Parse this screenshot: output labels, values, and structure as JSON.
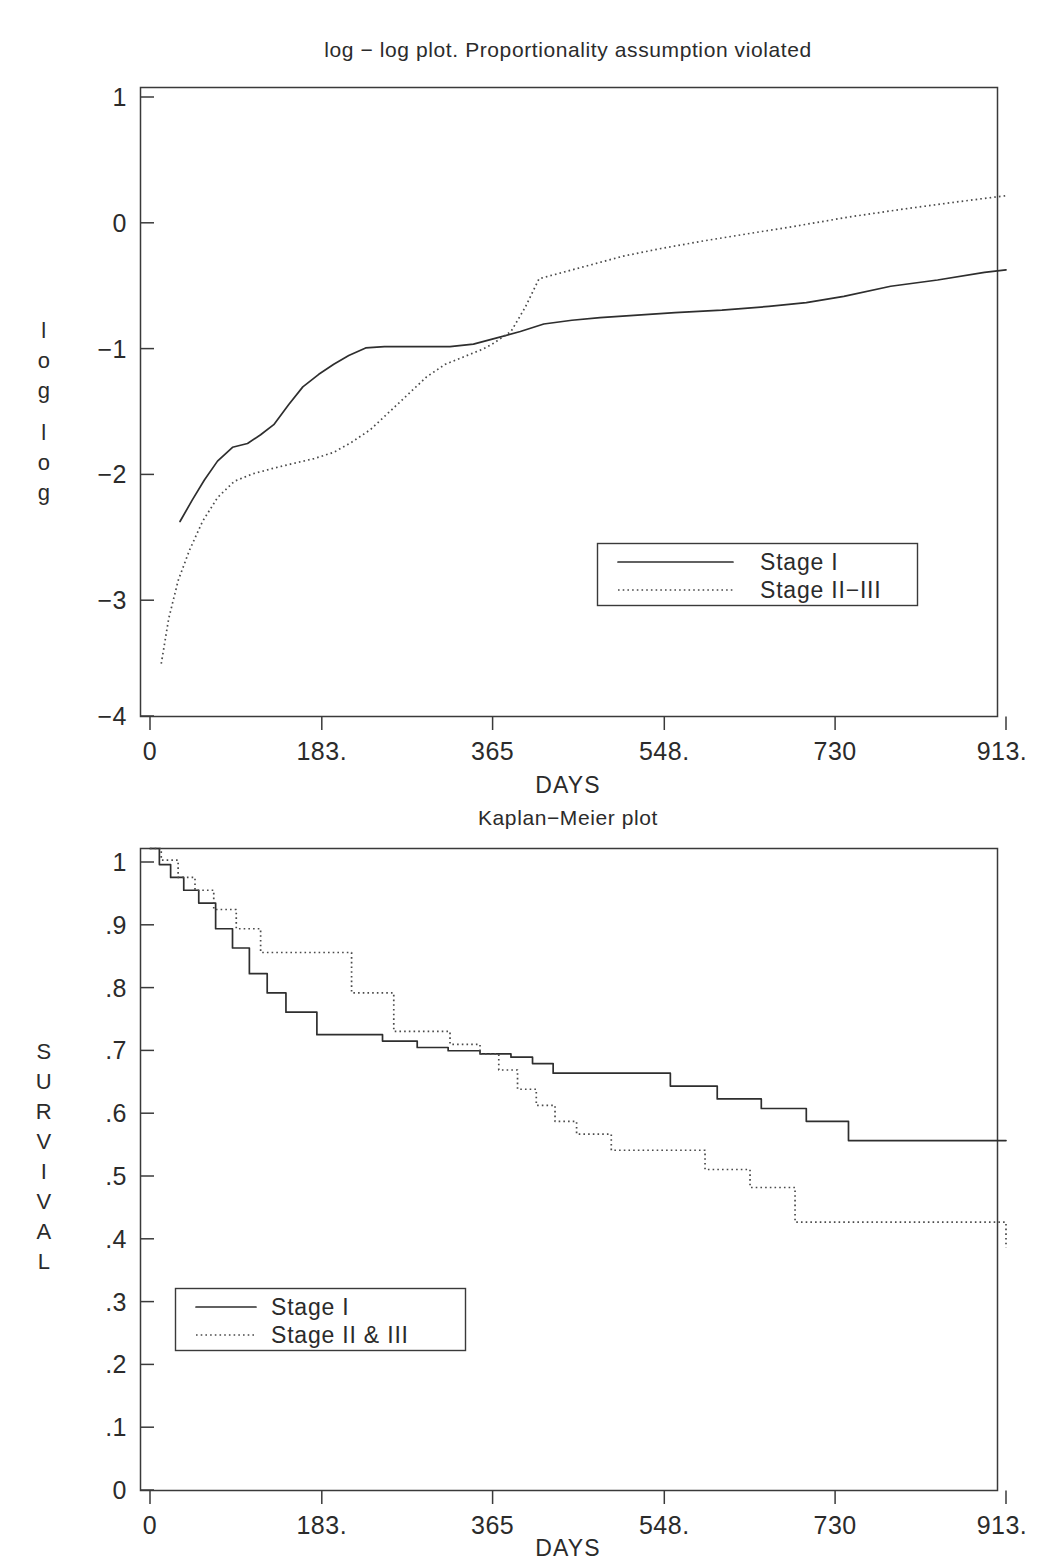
{
  "figure": {
    "width": 1041,
    "height": 1562,
    "background": "#ffffff",
    "line_color": "#2e2e2e"
  },
  "charts": [
    {
      "id": "loglog",
      "title": "log − log plot. Proportionality assumption violated",
      "xlabel": "DAYS",
      "ylabel_chars": [
        "l",
        "o",
        "g",
        "",
        "l",
        "o",
        "g"
      ],
      "ylabel": "log log",
      "xticks": [
        "0",
        "183.",
        "365",
        "548.",
        "730",
        "913."
      ],
      "xtick_values": [
        0,
        183,
        365,
        548,
        730,
        913
      ],
      "yticks": [
        "1",
        "0",
        "−1",
        "−2",
        "−3",
        "−4"
      ],
      "ytick_values": [
        1,
        0,
        -1,
        -2,
        -3,
        -4
      ],
      "legend": [
        {
          "label": "Stage I",
          "style": "solid"
        },
        {
          "label": "Stage II−III",
          "style": "dotted"
        }
      ]
    },
    {
      "id": "kaplanmeier",
      "title": "Kaplan−Meier plot",
      "xlabel": "DAYS",
      "ylabel_chars": [
        "S",
        "U",
        "R",
        "V",
        "I",
        "V",
        "A",
        "L"
      ],
      "ylabel": "SURVIVAL",
      "xticks": [
        "0",
        "183.",
        "365",
        "548.",
        "730",
        "913."
      ],
      "xtick_values": [
        0,
        183,
        365,
        548,
        730,
        913
      ],
      "yticks": [
        "1",
        ".9",
        ".8",
        ".7",
        ".6",
        ".5",
        ".4",
        ".3",
        ".2",
        ".1",
        "0"
      ],
      "ytick_values": [
        1,
        0.9,
        0.8,
        0.7,
        0.6,
        0.5,
        0.4,
        0.3,
        0.2,
        0.1,
        0
      ],
      "legend": [
        {
          "label": "Stage I",
          "style": "solid"
        },
        {
          "label": "Stage II & III",
          "style": "dotted"
        }
      ]
    }
  ],
  "chart_data": [
    {
      "type": "line",
      "id": "loglog",
      "title": "log − log plot. Proportionality assumption violated",
      "xlabel": "DAYS",
      "ylabel": "log log",
      "xlim": [
        0,
        913
      ],
      "ylim": [
        -4,
        1
      ],
      "grid": false,
      "legend_position": "lower-right",
      "series": [
        {
          "name": "Stage I",
          "style": "solid",
          "x": [
            32,
            45,
            58,
            72,
            88,
            104,
            118,
            132,
            148,
            163,
            180,
            196,
            212,
            230,
            250,
            272,
            295,
            320,
            345,
            365,
            395,
            420,
            450,
            480,
            520,
            560,
            610,
            660,
            700,
            740,
            790,
            840,
            890,
            913
          ],
          "y": [
            -2.45,
            -2.28,
            -2.12,
            -1.97,
            -1.86,
            -1.83,
            -1.76,
            -1.68,
            -1.52,
            -1.38,
            -1.28,
            -1.2,
            -1.13,
            -1.07,
            -1.06,
            -1.06,
            -1.06,
            -1.06,
            -1.04,
            -1.0,
            -0.94,
            -0.88,
            -0.85,
            -0.83,
            -0.81,
            -0.79,
            -0.77,
            -0.74,
            -0.71,
            -0.66,
            -0.58,
            -0.53,
            -0.47,
            -0.45
          ]
        },
        {
          "name": "Stage II−III",
          "style": "dotted",
          "x": [
            12,
            20,
            30,
            42,
            56,
            72,
            90,
            110,
            130,
            152,
            175,
            196,
            215,
            235,
            258,
            278,
            295,
            315,
            335,
            355,
            365,
            385,
            400,
            415,
            440,
            470,
            505,
            545,
            590,
            640,
            690,
            745,
            800,
            860,
            913
          ],
          "y": [
            -3.58,
            -3.22,
            -2.92,
            -2.68,
            -2.45,
            -2.26,
            -2.13,
            -2.07,
            -2.03,
            -1.99,
            -1.95,
            -1.9,
            -1.82,
            -1.72,
            -1.56,
            -1.42,
            -1.3,
            -1.2,
            -1.14,
            -1.08,
            -1.04,
            -0.94,
            -0.75,
            -0.52,
            -0.47,
            -0.41,
            -0.34,
            -0.28,
            -0.22,
            -0.16,
            -0.1,
            -0.03,
            0.03,
            0.09,
            0.14
          ]
        }
      ]
    },
    {
      "type": "line",
      "id": "kaplanmeier",
      "title": "Kaplan−Meier plot",
      "xlabel": "DAYS",
      "ylabel": "SURVIVAL",
      "xlim": [
        0,
        913
      ],
      "ylim": [
        0,
        1
      ],
      "grid": false,
      "legend_position": "lower-left",
      "step": true,
      "series": [
        {
          "name": "Stage I",
          "style": "solid",
          "x": [
            0,
            10,
            22,
            36,
            52,
            70,
            88,
            106,
            125,
            145,
            178,
            212,
            248,
            285,
            318,
            352,
            368,
            385,
            408,
            430,
            478,
            555,
            605,
            652,
            700,
            745,
            913
          ],
          "y": [
            1.0,
            0.975,
            0.955,
            0.935,
            0.915,
            0.875,
            0.845,
            0.805,
            0.775,
            0.745,
            0.71,
            0.71,
            0.7,
            0.69,
            0.685,
            0.68,
            0.68,
            0.675,
            0.665,
            0.65,
            0.65,
            0.63,
            0.61,
            0.595,
            0.575,
            0.545,
            0.545
          ]
        },
        {
          "name": "Stage II & III",
          "style": "dotted",
          "x": [
            0,
            12,
            30,
            48,
            68,
            92,
            118,
            162,
            215,
            260,
            320,
            352,
            372,
            392,
            412,
            432,
            455,
            492,
            545,
            592,
            640,
            688,
            790,
            913
          ],
          "y": [
            1.0,
            0.982,
            0.955,
            0.935,
            0.905,
            0.875,
            0.838,
            0.838,
            0.775,
            0.715,
            0.695,
            0.68,
            0.655,
            0.625,
            0.6,
            0.575,
            0.555,
            0.53,
            0.53,
            0.5,
            0.472,
            0.418,
            0.418,
            0.378
          ]
        }
      ]
    }
  ]
}
